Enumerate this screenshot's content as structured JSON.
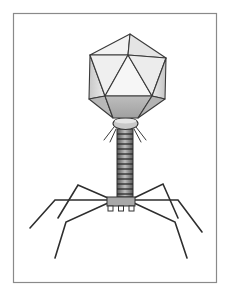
{
  "image": {
    "subject": "Bacteriophage pencil illustration",
    "style": "graphite pencil drawing on white paper with thin gray frame",
    "colors": {
      "background": "#ffffff",
      "frame": "#8a8a8a",
      "capsid_light": "#f0f0f0",
      "capsid_mid": "#d9d9d9",
      "capsid_dark": "#b5b5b5",
      "line": "#3a3a3a",
      "tail_dark": "#4a4a4a",
      "baseplate": "#a8a8a8"
    },
    "parts": [
      "icosahedral head (capsid)",
      "collar with whiskers",
      "contractile tail sheath",
      "baseplate",
      "six tail fibers"
    ]
  }
}
